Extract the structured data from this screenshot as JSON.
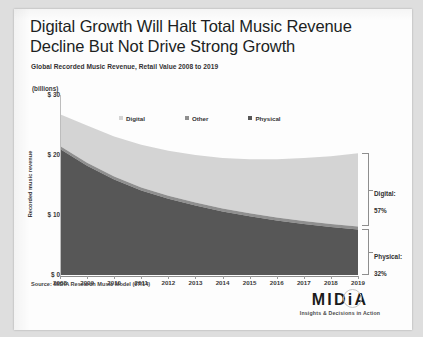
{
  "slide": {
    "title_line1": "Digital Growth Will Halt Total Music Revenue",
    "title_line2": "Decline But Not Drive Strong Growth",
    "subtitle": "Global Recorded Music Revenue, Retail Value 2008 to 2019",
    "units_label": "(billions)",
    "source": "Source: MIDiA Research Music Model (07/14)"
  },
  "logo": {
    "wordmark": "MIDiA",
    "tagline": "Insights & Decisions in Action"
  },
  "annotations": {
    "digital": {
      "name": "Digital:",
      "value": "57%"
    },
    "physical": {
      "name": "Physical:",
      "value": "32%"
    }
  },
  "colors": {
    "physical": "#575757",
    "other": "#8f8f8f",
    "digital": "#d4d4d4",
    "axis": "#8c8c8c",
    "text": "#2f2f2f",
    "card": "#fdfdfd",
    "page": "#dedede"
  },
  "chart_data": {
    "type": "area",
    "title": "Global Recorded Music Revenue, Retail Value 2008 to 2019",
    "xlabel": "",
    "ylabel": "Recorded music revenue",
    "units": "(billions)",
    "ylim": [
      0,
      30
    ],
    "yticks": [
      0,
      10,
      20,
      30
    ],
    "ytick_labels": [
      "$ 0",
      "$ 10",
      "$ 20",
      "$ 30"
    ],
    "grid": false,
    "legend_position": "top-center",
    "stacked": true,
    "categories": [
      "2008",
      "2009",
      "2010",
      "2011",
      "2012",
      "2013",
      "2014",
      "2015",
      "2016",
      "2017",
      "2018",
      "2019"
    ],
    "series": [
      {
        "name": "Physical",
        "color": "#575757",
        "values": [
          21.0,
          18.2,
          15.9,
          14.1,
          12.7,
          11.6,
          10.6,
          9.8,
          9.1,
          8.5,
          8.0,
          7.6
        ]
      },
      {
        "name": "Other",
        "color": "#8f8f8f",
        "values": [
          0.5,
          0.5,
          0.5,
          0.5,
          0.5,
          0.5,
          0.5,
          0.5,
          0.5,
          0.5,
          0.5,
          0.5
        ]
      },
      {
        "name": "Digital",
        "color": "#d4d4d4",
        "values": [
          5.3,
          6.2,
          6.7,
          7.1,
          7.5,
          7.9,
          8.4,
          9.0,
          9.7,
          10.5,
          11.3,
          12.2
        ]
      }
    ],
    "totals": [
      26.8,
      24.9,
      23.1,
      21.7,
      20.7,
      20.0,
      19.5,
      19.3,
      19.3,
      19.5,
      19.8,
      20.3
    ],
    "annotations": [
      {
        "label": "Digital:",
        "value": "57%",
        "target_series": "Digital",
        "at": "2019"
      },
      {
        "label": "Physical:",
        "value": "32%",
        "target_series": "Physical",
        "at": "2019"
      }
    ]
  }
}
